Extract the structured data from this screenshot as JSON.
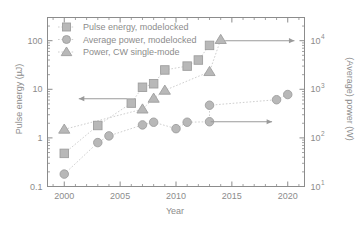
{
  "chart_data": {
    "type": "scatter",
    "title": "",
    "xlabel": "Year",
    "ylabel": "Pulse energy (µJ)",
    "ylabel_right": "(Average) power (W)",
    "xlim": [
      1998.5,
      2021.5
    ],
    "ylim": [
      0.1,
      300
    ],
    "ylim_right": [
      10,
      30000
    ],
    "yscale": "log",
    "yscale_right": "log",
    "grid": false,
    "legend_position": "top-left",
    "xticks": [
      2000,
      2005,
      2010,
      2015,
      2020
    ],
    "xticklabels": [
      "2000",
      "2005",
      "2010",
      "2015",
      "2020"
    ],
    "yticks": [
      0.1,
      1,
      10,
      100
    ],
    "yticklabels": [
      "0.1",
      "1",
      "10",
      "100"
    ],
    "yticks_right": [
      10,
      100,
      1000,
      10000
    ],
    "yticklabels_right": [
      "10",
      "10",
      "10",
      "10"
    ],
    "yticklabels_right_exp": [
      "1",
      "2",
      "3",
      "4"
    ],
    "series": [
      {
        "name": "Pulse energy, modelocked",
        "marker": "square",
        "axis": "left",
        "color": "#b8b8b8",
        "x": [
          2000,
          2003,
          2006,
          2007,
          2008,
          2009,
          2011,
          2012,
          2013
        ],
        "y": [
          0.48,
          1.8,
          5.2,
          11,
          13,
          25,
          30,
          40,
          80
        ]
      },
      {
        "name": "Average power, modelocked",
        "marker": "circle",
        "axis": "left",
        "color": "#b8b8b8",
        "x": [
          2000,
          2003,
          2004,
          2007,
          2008,
          2010,
          2011,
          2013,
          2013,
          2019,
          2020
        ],
        "y": [
          0.18,
          0.8,
          1.1,
          1.85,
          2.1,
          1.55,
          2.1,
          2.15,
          4.7,
          6.1,
          7.8
        ]
      },
      {
        "name": "Power, CW single-mode",
        "marker": "triangle",
        "axis": "left",
        "color": "#b8b8b8",
        "x": [
          2000,
          2007,
          2008,
          2009,
          2013,
          2014
        ],
        "y": [
          1.5,
          3.9,
          6.5,
          9.5,
          23,
          105
        ]
      }
    ],
    "annotations": [
      {
        "type": "arrow",
        "direction": "left",
        "axis": "left",
        "from_x": 2005.6,
        "to_x": 2001.3,
        "y": 6.4
      },
      {
        "type": "arrow",
        "direction": "right",
        "axis": "left",
        "from_x": 2014.4,
        "to_x": 2020.6,
        "y": 100
      },
      {
        "type": "arrow",
        "direction": "right",
        "axis": "left",
        "from_x": 2013.1,
        "to_x": 2018.6,
        "y": 2.15
      }
    ]
  },
  "legend": {
    "items": [
      {
        "label": "Pulse energy, modelocked",
        "marker": "square"
      },
      {
        "label": "Average power, modelocked",
        "marker": "circle"
      },
      {
        "label": "Power, CW single-mode",
        "marker": "triangle"
      }
    ]
  },
  "colors": {
    "marker": "#b8b8b8",
    "marker_edge": "#9e9e9e",
    "axis": "#8c8c8c",
    "text": "#8c8c8c",
    "connector": "#cfcfcf",
    "arrow": "#9a9a9a",
    "background": "#ffffff"
  }
}
